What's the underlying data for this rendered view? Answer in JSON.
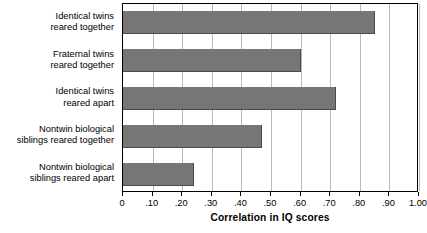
{
  "chart_data": {
    "type": "bar",
    "orientation": "horizontal",
    "title": "",
    "xlabel": "Correlation in IQ scores",
    "ylabel": "",
    "xlim": [
      0,
      1.0
    ],
    "grid": true,
    "legend": false,
    "bar_color": "#767676",
    "categories": [
      "Identical twins\nreared together",
      "Fraternal twins\nreared together",
      "Identical twins\nreared apart",
      "Nontwin biological\nsiblings reared together",
      "Nontwin biological\nsiblings reared apart"
    ],
    "values": [
      0.85,
      0.6,
      0.72,
      0.47,
      0.24
    ],
    "xticks": [
      0,
      0.1,
      0.2,
      0.3,
      0.4,
      0.5,
      0.6,
      0.7,
      0.8,
      0.9,
      1.0
    ],
    "xticklabels": [
      "0",
      ".10",
      ".20",
      ".30",
      ".40",
      ".50",
      ".60",
      ".70",
      ".80",
      ".90",
      "1.00"
    ]
  },
  "axis": {
    "title": "Correlation in IQ scores"
  }
}
